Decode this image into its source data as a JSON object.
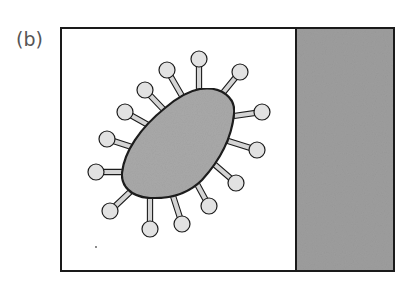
{
  "figure": {
    "panel_label": "(b)",
    "colors": {
      "frame": "#1a1a1a",
      "background": "#ffffff",
      "body_fill": "#a9a9a9",
      "spike_ball_fill": "#e2e2e2",
      "spike_stem_fill": "#d4d4d4",
      "outline": "#1c1c1c",
      "side_panel_fill": "#9e9e9e"
    },
    "frame": {
      "x": 61,
      "y": 28,
      "width": 333,
      "height": 243
    },
    "divider_x": 296,
    "body_path": "M 200 89 C 222 86, 236 98, 234 114 C 232 135, 222 158, 202 180 C 188 194, 170 199, 150 198 C 130 197, 121 185, 122 173 C 124 152, 140 128, 165 108 C 178 97, 188 91, 200 89 Z",
    "spikes": [
      {
        "ball": [
          199,
          59
        ],
        "base": [
          199,
          89
        ]
      },
      {
        "ball": [
          240,
          72
        ],
        "base": [
          222,
          94
        ]
      },
      {
        "ball": [
          167,
          70
        ],
        "base": [
          182,
          96
        ]
      },
      {
        "ball": [
          145,
          90
        ],
        "base": [
          164,
          110
        ]
      },
      {
        "ball": [
          125,
          112
        ],
        "base": [
          150,
          126
        ]
      },
      {
        "ball": [
          262,
          112
        ],
        "base": [
          234,
          116
        ]
      },
      {
        "ball": [
          107,
          139
        ],
        "base": [
          135,
          148
        ]
      },
      {
        "ball": [
          257,
          150
        ],
        "base": [
          228,
          141
        ]
      },
      {
        "ball": [
          96,
          172
        ],
        "base": [
          123,
          172
        ]
      },
      {
        "ball": [
          236,
          183
        ],
        "base": [
          214,
          164
        ]
      },
      {
        "ball": [
          110,
          211
        ],
        "base": [
          130,
          192
        ]
      },
      {
        "ball": [
          209,
          206
        ],
        "base": [
          197,
          184
        ]
      },
      {
        "ball": [
          150,
          229
        ],
        "base": [
          150,
          198
        ]
      },
      {
        "ball": [
          182,
          224
        ],
        "base": [
          173,
          196
        ]
      }
    ],
    "ball_radius": 8
  }
}
